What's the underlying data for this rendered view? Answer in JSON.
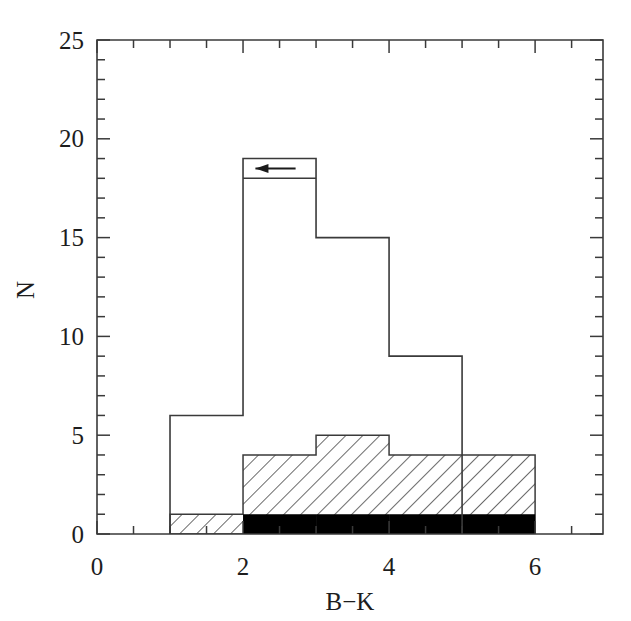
{
  "figure": {
    "width": 631,
    "height": 621,
    "background": "#ffffff",
    "ink_color": "#3a3a3a"
  },
  "chart_data": {
    "type": "bar",
    "subtype": "stepped-histogram-overlay",
    "title": "",
    "xlabel": "B−K",
    "ylabel": "N",
    "xlim": [
      0,
      6.93
    ],
    "ylim": [
      0,
      25
    ],
    "grid": false,
    "legend": "none",
    "bin_width": 1,
    "x_major_ticks": [
      0,
      2,
      4,
      6
    ],
    "x_major_tick_labels": [
      "0",
      "2",
      "4",
      "6"
    ],
    "x_minor_tick_step": 0.5,
    "y_major_ticks": [
      0,
      5,
      10,
      15,
      20,
      25
    ],
    "y_major_tick_labels": [
      "0",
      "5",
      "10",
      "15",
      "20",
      "25"
    ],
    "y_minor_tick_step": 1,
    "series": [
      {
        "name": "total",
        "style": "open-outline",
        "fill": "none",
        "stroke": "#3a3a3a",
        "bins": [
          {
            "x0": 1,
            "x1": 2,
            "value": 6
          },
          {
            "x0": 2,
            "x1": 3,
            "value": 19
          },
          {
            "x0": 3,
            "x1": 4,
            "value": 15
          },
          {
            "x0": 4,
            "x1": 5,
            "value": 9
          }
        ]
      },
      {
        "name": "hatched",
        "style": "diagonal-hatch",
        "fill": "#ffffff",
        "hatch": "45deg",
        "stroke": "#3a3a3a",
        "bins": [
          {
            "x0": 1,
            "x1": 2,
            "value": 1
          },
          {
            "x0": 2,
            "x1": 3,
            "value": 4
          },
          {
            "x0": 3,
            "x1": 4,
            "value": 5
          },
          {
            "x0": 4,
            "x1": 5,
            "value": 4
          },
          {
            "x0": 5,
            "x1": 6,
            "value": 4
          }
        ]
      },
      {
        "name": "filled",
        "style": "solid-black",
        "fill": "#000000",
        "stroke": "none",
        "bins": [
          {
            "x0": 2,
            "x1": 3,
            "value": 1
          },
          {
            "x0": 3,
            "x1": 4,
            "value": 1
          },
          {
            "x0": 4,
            "x1": 5,
            "value": 1
          },
          {
            "x0": 5,
            "x1": 6,
            "value": 1
          }
        ]
      }
    ],
    "annotations": [
      {
        "type": "arrow",
        "direction": "left",
        "x_start": 2.72,
        "x_end": 2.17,
        "y": 18.5,
        "note": "upper-limit arrow inside peak bin"
      },
      {
        "type": "line",
        "orientation": "horizontal",
        "x0": 2,
        "x1": 3,
        "y": 18,
        "note": "inner level line at N=18 across peak bin"
      }
    ]
  },
  "labels": {
    "y_axis_title": "N",
    "x_axis_title": "B−K",
    "x_tick_0": "0",
    "x_tick_2": "2",
    "x_tick_4": "4",
    "x_tick_6": "6",
    "y_tick_0": "0",
    "y_tick_5": "5",
    "y_tick_10": "10",
    "y_tick_15": "15",
    "y_tick_20": "20",
    "y_tick_25": "25"
  }
}
